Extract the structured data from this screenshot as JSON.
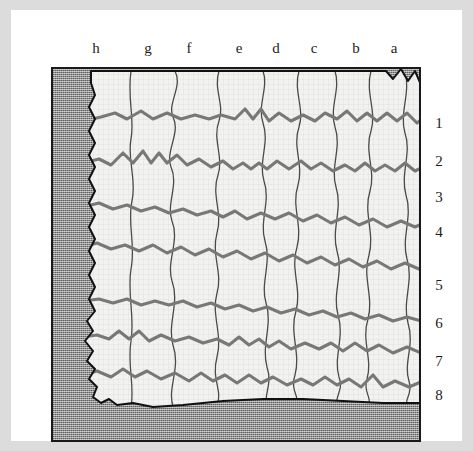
{
  "figure": {
    "kind": "excavation-grid-plan",
    "colors": {
      "page_margin": "#dcdcdc",
      "paper": "#ffffff",
      "frame_border": "#1a1a1a",
      "stipple_fill": "#8d8d8d",
      "exposed_fill": "#f2f2f0",
      "grid_line_heavy": "#787878",
      "grid_line_light": "#4a4a4a",
      "outline": "#111111",
      "label_text": "#1d1d1d"
    }
  },
  "columns": {
    "axis_name": "column-letters",
    "order_left_to_right": [
      "h",
      "g",
      "f",
      "e",
      "d",
      "c",
      "b",
      "a"
    ],
    "labels": [
      {
        "text": "h",
        "x": 85
      },
      {
        "text": "g",
        "x": 137
      },
      {
        "text": "f",
        "x": 178
      },
      {
        "text": "e",
        "x": 228
      },
      {
        "text": "d",
        "x": 265
      },
      {
        "text": "c",
        "x": 303
      },
      {
        "text": "b",
        "x": 345
      },
      {
        "text": "a",
        "x": 383
      }
    ]
  },
  "rows": {
    "axis_name": "row-numbers",
    "order_top_to_bottom": [
      "1",
      "2",
      "3",
      "4",
      "5",
      "6",
      "7",
      "8"
    ],
    "labels": [
      {
        "text": "1",
        "y": 106
      },
      {
        "text": "2",
        "y": 144
      },
      {
        "text": "3",
        "y": 180
      },
      {
        "text": "4",
        "y": 215
      },
      {
        "text": "5",
        "y": 268
      },
      {
        "text": "6",
        "y": 306
      },
      {
        "text": "7",
        "y": 344
      },
      {
        "text": "8",
        "y": 378
      }
    ]
  },
  "geometry": {
    "frame": {
      "left": 40,
      "top": 57,
      "width": 370,
      "height": 375
    },
    "exposed_area_outline": "M 38 2 L 333 2 L 340 10 L 348 0 L 355 12 L 362 2 L 368 16 L 374 4 L 381 20 L 388 6 L 394 22 L 400 10 L 406 28 L 412 16 L 416 30 L 410 36 L 418 44 L 410 50 L 416 58 L 408 64 L 414 72 L 406 80 L 412 90 L 404 100 L 410 112 L 402 122 L 404 136 L 398 146 L 400 160 L 395 172 L 397 186 L 392 196 L 394 214 L 390 226 L 392 244 L 388 256 L 390 272 L 386 286 L 388 300 L 384 312 L 386 326 L 380 334 L 330 334 L 290 332 L 250 330 L 210 330 L 170 332 L 130 336 L 100 338 L 80 334 L 64 336 L 56 330 L 48 334 L 40 328 L 44 318 L 36 310 L 42 300 L 34 292 L 40 282 L 32 272 L 40 262 L 34 252 L 42 242 L 36 230 L 42 218 L 36 206 L 42 194 L 36 182 L 42 170 L 36 158 L 42 146 L 36 134 L 42 122 L 36 110 L 42 98 L 36 86 L 42 74 L 36 62 L 42 50 L 36 38 L 42 26 L 38 14 Z",
    "horizontal_grid_lines": 7,
    "vertical_grid_lines": 7
  }
}
